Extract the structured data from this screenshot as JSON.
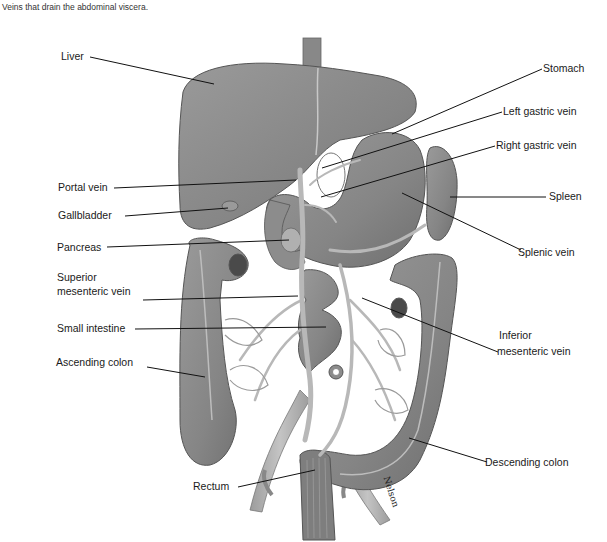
{
  "caption": "Veins that drain the abdominal viscera.",
  "signature": "Nelson",
  "colors": {
    "organ_fill": "#8a8a8a",
    "organ_dark": "#6e6e6e",
    "organ_light": "#a8a8a8",
    "vein_fill": "#b5b5b5",
    "leader_line": "#111111",
    "background": "#ffffff"
  },
  "labels": {
    "liver": "Liver",
    "stomach": "Stomach",
    "left_gastric_vein": "Left gastric vein",
    "right_gastric_vein": "Right gastric vein",
    "portal_vein": "Portal vein",
    "gallbladder": "Gallbladder",
    "spleen": "Spleen",
    "pancreas": "Pancreas",
    "splenic_vein": "Splenic vein",
    "superior_mesenteric_vein_line1": "Superior",
    "superior_mesenteric_vein_line2": "mesenteric vein",
    "small_intestine": "Small intestine",
    "inferior_mesenteric_vein_line1": "Inferior",
    "inferior_mesenteric_vein_line2": "mesenteric vein",
    "ascending_colon": "Ascending colon",
    "descending_colon": "Descending colon",
    "rectum": "Rectum"
  }
}
